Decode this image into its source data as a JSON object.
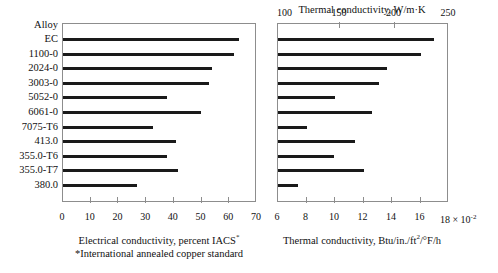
{
  "chart_data": {
    "type": "bar",
    "title": "",
    "orientation": "horizontal",
    "row_header": "Alloy",
    "categories": [
      "EC",
      "1100-0",
      "2024-0",
      "3003-0",
      "5052-0",
      "6061-0",
      "7075-T6",
      "413.0",
      "355.0-T6",
      "355.0-T7",
      "380.0"
    ],
    "panels": [
      {
        "id": "electrical",
        "axis_position": "bottom",
        "xlabel": "Electrical conductivity, percent IACS",
        "xlabel_superscript": "*",
        "footnote": "*International annealed copper standard",
        "xlim": [
          0,
          70
        ],
        "ticks": [
          0,
          10,
          20,
          30,
          40,
          50,
          60,
          70
        ],
        "ticklabels": [
          "0",
          "10",
          "20",
          "30",
          "40",
          "50",
          "60",
          "70"
        ],
        "grid": false,
        "values": [
          64,
          62,
          54,
          53,
          38,
          50,
          33,
          41,
          38,
          42,
          27
        ]
      },
      {
        "id": "thermal",
        "axis_position": "both",
        "top_label": "Thermal conductivity, W/m·K",
        "top_xlim": [
          93,
          250
        ],
        "top_ticks": [
          100,
          150,
          200,
          250
        ],
        "top_ticklabels": [
          "100",
          "150",
          "200",
          "250"
        ],
        "bottom_label": "Thermal conductivity, Btu/in./ft",
        "bottom_label_sup": "2",
        "bottom_label_tail": "/°F/h",
        "bottom_xlim": [
          6,
          18
        ],
        "bottom_ticks": [
          6,
          8,
          10,
          12,
          14,
          16,
          18
        ],
        "bottom_ticklabels": [
          "6",
          "8",
          "10",
          "12",
          "14",
          "16",
          "18"
        ],
        "bottom_multiplier": "× 10",
        "bottom_multiplier_exp": "-2",
        "grid": false,
        "values": [
          237,
          225,
          194,
          187,
          146,
          180,
          121,
          165,
          145,
          173,
          112
        ]
      }
    ]
  },
  "colors": {
    "bar": "#1a1a1a",
    "frame": "#8d8d8d",
    "text": "#111111"
  }
}
